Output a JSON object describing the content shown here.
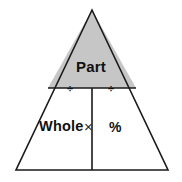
{
  "diagram": {
    "type": "formula-triangle",
    "background_color": "#ffffff",
    "stroke_color": "#1a1a1a",
    "shaded_fill_color": "#c6c6c6",
    "unshaded_fill_color": "#ffffff",
    "geometry": {
      "apex": [
        92,
        10
      ],
      "bottom_left": [
        16,
        170
      ],
      "bottom_right": [
        168,
        170
      ],
      "divider_y": 88,
      "divider_left_x": 48,
      "divider_right_x": 136,
      "center_x": 92,
      "stroke_width": 1.6
    },
    "regions": {
      "top": {
        "label": "Part",
        "shaded": true
      },
      "bottom_left": {
        "label": "Whole",
        "shaded": false
      },
      "bottom_right": {
        "label": "%",
        "shaded": false
      }
    },
    "operators": {
      "divide_left": "÷",
      "divide_right": "÷",
      "multiply": "×"
    }
  }
}
